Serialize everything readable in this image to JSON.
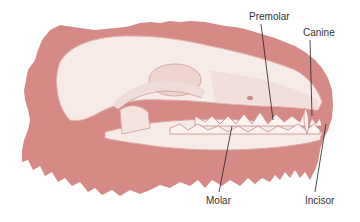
{
  "figure": {
    "colors": {
      "background": "#ffffff",
      "fur_shape": "#d68a86",
      "bone": "#f7ebe8",
      "bone_shadow": "#e6c3bd",
      "leader_line": "#222222"
    },
    "labels": [
      {
        "id": "premolar",
        "text": "Premolar",
        "x": 249,
        "y": 12
      },
      {
        "id": "canine",
        "text": "Canine",
        "x": 303,
        "y": 28
      },
      {
        "id": "molar",
        "text": "Molar",
        "x": 206,
        "y": 197
      },
      {
        "id": "incisor",
        "text": "Incisor",
        "x": 305,
        "y": 197
      }
    ]
  }
}
